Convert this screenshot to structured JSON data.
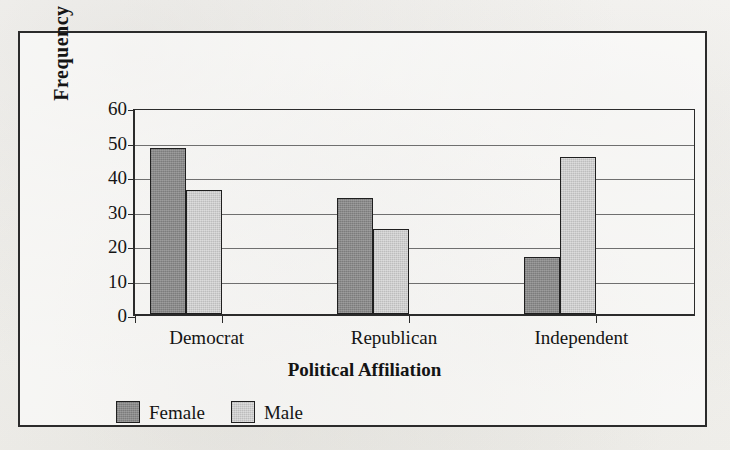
{
  "chart_data": {
    "type": "bar",
    "title": "",
    "xlabel": "Political Affiliation",
    "ylabel": "Frequency",
    "categories": [
      "Democrat",
      "Republican",
      "Independent"
    ],
    "series": [
      {
        "name": "Female",
        "color": "#8a8a8a",
        "values": [
          48,
          33.5,
          16.5
        ]
      },
      {
        "name": "Male",
        "color": "#cdcdcd",
        "values": [
          36,
          24.5,
          45.5
        ]
      }
    ],
    "ylim": [
      0,
      60
    ],
    "ytick_labels": [
      "60",
      "50",
      "40",
      "30",
      "20",
      "10",
      "0"
    ],
    "ytick_values": [
      60,
      50,
      40,
      30,
      20,
      10,
      0
    ],
    "grid": true,
    "legend_position": "bottom-left"
  },
  "frame": {
    "border_color": "#2b2b2b",
    "background": "#f7f6f3"
  }
}
